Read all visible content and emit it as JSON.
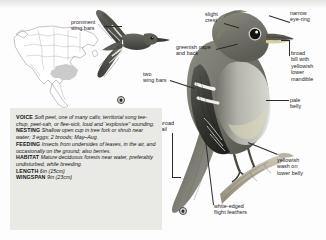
{
  "page": {
    "species_plate": "flycatcher-field-guide-plate",
    "background_color": "#fdfdfd"
  },
  "range_map": {
    "name": "north-america-range-map",
    "land_color": "#ffffff",
    "outline_color": "#7a7a7a",
    "range_color": "#bfbfbf"
  },
  "annotations": [
    {
      "id": "prominent-wing-bars",
      "text": "prominent\nwing bars"
    },
    {
      "id": "slight-crest",
      "text": "slight\ncrest"
    },
    {
      "id": "narrow-eye-ring",
      "text": "narrow\neye-ring"
    },
    {
      "id": "greenish-nape-and-back",
      "text": "greenish nape\nand back"
    },
    {
      "id": "broad-bill-with-yellowish-lower-mandible",
      "text": "broad\nbill with\nyellowish\nlower\nmandible"
    },
    {
      "id": "two-wing-bars",
      "text": "two\nwing bars"
    },
    {
      "id": "pale-belly",
      "text": "pale\nbelly"
    },
    {
      "id": "broad-tail",
      "text": "broad\ntail"
    },
    {
      "id": "yellowish-wash-on-lower-belly",
      "text": "yellowish\nwash on\nlower belly"
    },
    {
      "id": "white-edged-flight-feathers",
      "text": "white-edged\nflight feathers"
    }
  ],
  "facts": {
    "voice": {
      "label": "VOICE",
      "text": "Soft peet, one of many calls; territorial song tee-chup, peet-sah, or flee-sick, loud and “explosive” sounding."
    },
    "nesting": {
      "label": "NESTING",
      "text": "Shallow open cup in tree fork or shrub near water; 3 eggs; 2 broods; May–Aug."
    },
    "feeding": {
      "label": "FEEDING",
      "text": "Insects from undersides of leaves, in the air, and occasionally on the ground; also berries."
    },
    "habitat": {
      "label": "HABITAT",
      "text": "Mature deciduous forests near water, preferably undisturbed, while breeding."
    },
    "length": {
      "label": "LENGTH",
      "text": "6in (15cm)"
    },
    "wingspan": {
      "label": "WINGSPAN",
      "text": "9in (23cm)"
    }
  },
  "badges": [
    {
      "id": "flight-figure-badge",
      "glyph": "◆"
    },
    {
      "id": "perched-figure-badge",
      "glyph": "◆"
    }
  ]
}
